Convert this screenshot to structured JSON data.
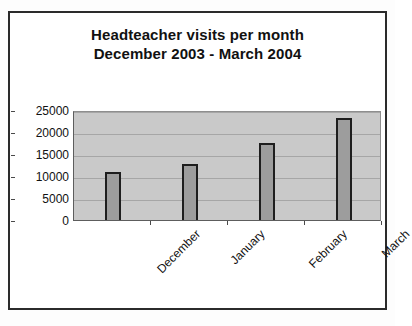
{
  "chart_data": {
    "type": "bar",
    "title": "Headteacher visits per month December 2003 - March 2004",
    "title_lines": [
      "Headteacher visits per month",
      "December 2003 - March 2004"
    ],
    "categories": [
      "December",
      "January",
      "February",
      "March"
    ],
    "values": [
      10800,
      12800,
      17400,
      23200
    ],
    "xlabel": "",
    "ylabel": "",
    "ylim": [
      0,
      25000
    ],
    "ytick_labels": [
      "0",
      "5000",
      "10000",
      "15000",
      "20000",
      "25000"
    ],
    "ytick_values": [
      0,
      5000,
      10000,
      15000,
      20000,
      25000
    ],
    "grid": true,
    "legend": false,
    "series": [
      {
        "name": "Headteacher visits",
        "values": [
          10800,
          12800,
          17400,
          23200
        ]
      }
    ],
    "colors": {
      "bar_fill": "#9d9d9d",
      "bar_border": "#1e1e1e",
      "plot_background": "#c9c9c9",
      "gridline": "#a6a6a6",
      "axis": "#5d5d5d",
      "text": "#111111",
      "frame_border": "#2b2b2b"
    }
  }
}
